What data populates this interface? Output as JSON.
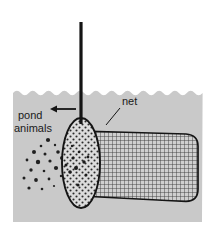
{
  "figure": {
    "background_color": "#ffffff",
    "water_color": "#c9c9c9",
    "water_edge_color": "#d7d7d7",
    "ink_color": "#141414",
    "net_mouth_fill": "#dcdcdc",
    "net_body_fill": "#cfcfcf"
  },
  "labels": {
    "pond_animals_line1": "pond",
    "pond_animals_line2": "animals",
    "net": "net"
  },
  "icons": {
    "direction_arrow": "arrow-left-icon",
    "handle": "net-handle-icon",
    "water_surface": "water-surface-icon",
    "net_mouth": "net-mouth-ellipse-icon",
    "net_body": "net-mesh-body-icon",
    "animals": "pond-animal-speck-icon"
  },
  "geometry": {
    "water_panel": {
      "x": 13,
      "y": 88,
      "width": 189,
      "height": 134
    },
    "handle": {
      "x": 81,
      "y_top": 22,
      "y_bottom": 124,
      "width": 3
    },
    "arrow": {
      "x_start": 76,
      "x_end": 50,
      "y": 109
    },
    "net_mouth": {
      "cx": 81,
      "cy": 163,
      "rx": 19,
      "ry": 45
    },
    "net_body_top_right": {
      "x": 198,
      "y": 134
    },
    "net_body_bottom_right": {
      "x": 198,
      "y": 201
    },
    "net_label_anchor": {
      "x": 122,
      "y": 105
    },
    "net_leader_end": {
      "x": 106,
      "y": 124
    }
  },
  "animals": [
    {
      "cx": 48,
      "cy": 140,
      "r": 2.1
    },
    {
      "cx": 41,
      "cy": 146,
      "r": 1.3
    },
    {
      "cx": 55,
      "cy": 145,
      "r": 1.2
    },
    {
      "cx": 34,
      "cy": 152,
      "r": 2.0
    },
    {
      "cx": 45,
      "cy": 154,
      "r": 1.5
    },
    {
      "cx": 58,
      "cy": 152,
      "r": 1.8
    },
    {
      "cx": 27,
      "cy": 160,
      "r": 1.4
    },
    {
      "cx": 38,
      "cy": 162,
      "r": 2.2
    },
    {
      "cx": 50,
      "cy": 161,
      "r": 1.6
    },
    {
      "cx": 62,
      "cy": 158,
      "r": 2.0
    },
    {
      "cx": 31,
      "cy": 170,
      "r": 1.7
    },
    {
      "cx": 44,
      "cy": 171,
      "r": 1.3
    },
    {
      "cx": 56,
      "cy": 168,
      "r": 2.1
    },
    {
      "cx": 24,
      "cy": 178,
      "r": 1.5
    },
    {
      "cx": 36,
      "cy": 180,
      "r": 1.9
    },
    {
      "cx": 49,
      "cy": 179,
      "r": 1.4
    },
    {
      "cx": 61,
      "cy": 176,
      "r": 1.2
    },
    {
      "cx": 29,
      "cy": 188,
      "r": 1.6
    },
    {
      "cx": 42,
      "cy": 189,
      "r": 1.3
    },
    {
      "cx": 54,
      "cy": 186,
      "r": 1.1
    },
    {
      "cx": 66,
      "cy": 165,
      "r": 1.5
    },
    {
      "cx": 70,
      "cy": 172,
      "r": 1.8
    },
    {
      "cx": 73,
      "cy": 158,
      "r": 1.6
    },
    {
      "cx": 76,
      "cy": 168,
      "r": 2.0
    },
    {
      "cx": 79,
      "cy": 152,
      "r": 1.3
    },
    {
      "cx": 84,
      "cy": 162,
      "r": 1.7
    },
    {
      "cx": 88,
      "cy": 157,
      "r": 1.4
    },
    {
      "cx": 86,
      "cy": 175,
      "r": 1.5
    },
    {
      "cx": 78,
      "cy": 185,
      "r": 1.6
    },
    {
      "cx": 72,
      "cy": 146,
      "r": 1.2
    }
  ]
}
